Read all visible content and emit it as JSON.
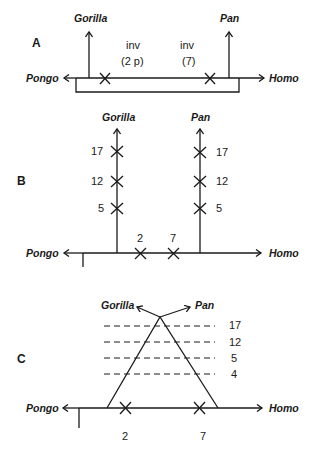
{
  "panels": {
    "A": {
      "label": "A",
      "left_taxon": "Pongo",
      "right_taxon": "Homo",
      "branch_left": "Gorilla",
      "branch_right": "Pan",
      "inv_left_line1": "inv",
      "inv_left_line2": "(2 p)",
      "inv_right_line1": "inv",
      "inv_right_line2": "(7)"
    },
    "B": {
      "label": "B",
      "left_taxon": "Pongo",
      "right_taxon": "Homo",
      "branch_left": "Gorilla",
      "branch_right": "Pan",
      "gorilla_marks": [
        "17",
        "12",
        "5"
      ],
      "pan_marks": [
        "17",
        "12",
        "5"
      ],
      "baseline_marks": [
        "2",
        "7"
      ]
    },
    "C": {
      "label": "C",
      "left_taxon": "Pongo",
      "right_taxon": "Homo",
      "branch_left": "Gorilla",
      "branch_right": "Pan",
      "dashed_levels": [
        "17",
        "12",
        "5",
        "4"
      ],
      "baseline_marks": [
        "2",
        "7"
      ]
    }
  },
  "colors": {
    "ink": "#1a1a1a",
    "background": "#ffffff"
  }
}
